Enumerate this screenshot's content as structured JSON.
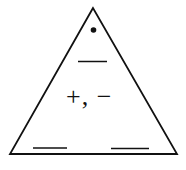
{
  "diagram": {
    "type": "fact-family-triangle",
    "top_marker": "•",
    "operations": "+, −",
    "blanks": {
      "top": "",
      "bottom_left": "",
      "bottom_right": ""
    },
    "colors": {
      "stroke": "#111111",
      "background": "#ffffff"
    }
  }
}
